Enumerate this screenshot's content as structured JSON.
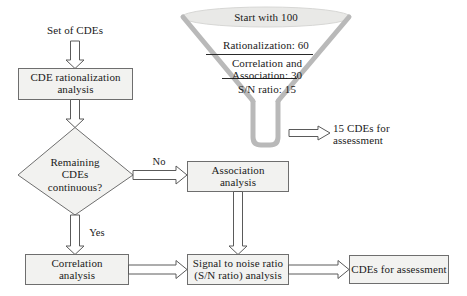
{
  "diagram": {
    "colors": {
      "box_fill": "#f2f2f0",
      "box_stroke": "#6e6e6e",
      "arrow_fill": "#ffffff",
      "arrow_stroke": "#5a5a5a",
      "funnel_stroke": "#b5b5b5",
      "funnel_top_fill": "#e8e8e6",
      "text": "#1a1a1a"
    },
    "start_label": "Set of CDEs",
    "nodes": [
      {
        "id": "rationalization",
        "shape": "process",
        "label": "CDE rationalization\nanalysis"
      },
      {
        "id": "decision",
        "shape": "decision",
        "label": "Remaining\nCDEs\ncontinuous?"
      },
      {
        "id": "association",
        "shape": "process",
        "label": "Association\nanalysis"
      },
      {
        "id": "correlation",
        "shape": "process",
        "label": "Correlation\nanalysis"
      },
      {
        "id": "snr",
        "shape": "process",
        "label": "Signal to noise ratio\n(S/N ratio) analysis"
      },
      {
        "id": "final",
        "shape": "process",
        "label": "CDEs for assessment"
      }
    ],
    "edge_labels": {
      "no": "No",
      "yes": "Yes"
    },
    "funnel": {
      "stages": [
        {
          "label": "Start with 100",
          "value": 100
        },
        {
          "label": "Rationalization: 60",
          "value": 60
        },
        {
          "label": "Correlation and\nAssociation: 30",
          "value": 30
        },
        {
          "label": "S/N ratio: 15",
          "value": 15
        }
      ],
      "output_label": "15 CDEs for\nassessment"
    }
  }
}
